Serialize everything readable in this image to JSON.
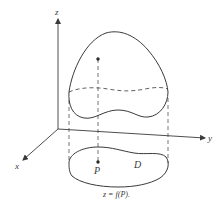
{
  "diagram": {
    "type": "3d-surface-over-domain",
    "axes": {
      "x": {
        "label": "x"
      },
      "y": {
        "label": "y"
      },
      "z": {
        "label": "z"
      }
    },
    "labels": {
      "point": "P",
      "domain": "D"
    },
    "caption": "z = f(P).",
    "colors": {
      "stroke": "#3a3a3a",
      "background": "#ffffff"
    }
  }
}
